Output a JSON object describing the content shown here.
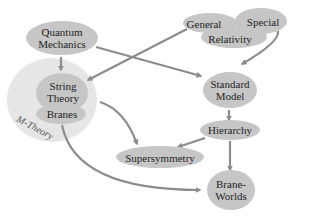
{
  "colors": {
    "node_fill": "#c6c6c6",
    "mtheory_fill": "#e6e6e6",
    "arrow": "#8c8c8c",
    "text": "#1e1e1e"
  },
  "nodes": {
    "quantum_mechanics": {
      "line1": "Quantum",
      "line2": "Mechanics"
    },
    "general": {
      "label": "General"
    },
    "special": {
      "label": "Special"
    },
    "relativity": {
      "label": "Relativity"
    },
    "string_theory": {
      "line1": "String",
      "line2": "Theory"
    },
    "branes": {
      "label": "Branes"
    },
    "m_theory": {
      "label": "M-Theory"
    },
    "standard_model": {
      "line1": "Standard",
      "line2": "Model"
    },
    "hierarchy": {
      "label": "Hierarchy"
    },
    "supersymmetry": {
      "label": "Supersymmetry"
    },
    "brane_worlds": {
      "line1": "Brane-",
      "line2": "Worlds"
    }
  },
  "edges": [
    {
      "from": "Quantum Mechanics",
      "to": "String Theory"
    },
    {
      "from": "Quantum Mechanics",
      "to": "Standard Model"
    },
    {
      "from": "General Relativity",
      "to": "String Theory"
    },
    {
      "from": "Special Relativity",
      "to": "Standard Model"
    },
    {
      "from": "Standard Model",
      "to": "Hierarchy"
    },
    {
      "from": "Hierarchy",
      "to": "Supersymmetry"
    },
    {
      "from": "Hierarchy",
      "to": "Brane-Worlds"
    },
    {
      "from": "Supersymmetry",
      "to": "String Theory"
    },
    {
      "from": "M-Theory",
      "to": "Brane-Worlds"
    }
  ]
}
